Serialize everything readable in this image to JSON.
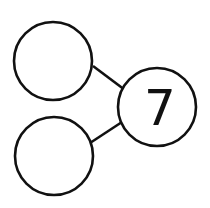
{
  "diagram": {
    "type": "number-bond",
    "whole": {
      "label": "7"
    },
    "parts": [
      {
        "label": ""
      },
      {
        "label": ""
      }
    ],
    "colors": {
      "stroke": "#111111",
      "fill": "#ffffff",
      "text": "#111111"
    }
  }
}
